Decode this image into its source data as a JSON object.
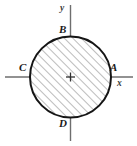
{
  "figure": {
    "kind": "geometry-diagram",
    "width": 137,
    "height": 146,
    "background_color": "#ffffff",
    "stroke_color": "#1a1a1a",
    "axis_color": "#6e6e6e",
    "hatch_color": "#7a7a7a",
    "circle": {
      "center_x": 70.5,
      "center_y": 77,
      "radius": 40.5,
      "fill": "#ffffff",
      "hatch_angle_deg": 45,
      "hatch_spacing": 6
    },
    "axes": {
      "x_axis": {
        "y": 77,
        "x_start": 5,
        "x_end": 133
      },
      "y_axis": {
        "x": 70.5,
        "y_start": 5,
        "y_end": 141
      }
    },
    "centroid_marker": {
      "x": 70.5,
      "y": 77,
      "type": "plus-marker",
      "size": 9
    },
    "point_labels": [
      {
        "id": "A",
        "text": "A",
        "position": "right",
        "x": 111,
        "y": 77
      },
      {
        "id": "B",
        "text": "B",
        "position": "top",
        "x": 70.5,
        "y": 36.5
      },
      {
        "id": "C",
        "text": "C",
        "position": "left",
        "x": 30,
        "y": 77
      },
      {
        "id": "D",
        "text": "D",
        "position": "bottom",
        "x": 70.5,
        "y": 117.5
      }
    ],
    "axis_labels": [
      {
        "id": "x",
        "text": "x"
      },
      {
        "id": "y",
        "text": "y"
      }
    ]
  }
}
